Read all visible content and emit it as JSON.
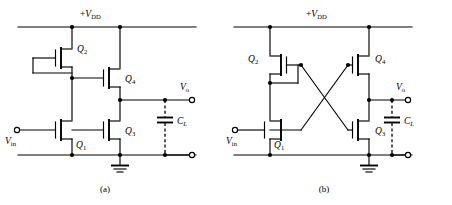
{
  "figure": {
    "panels": [
      {
        "id": "a",
        "caption": "(a)",
        "supply_label_prefix": "+",
        "supply_label_var": "V",
        "supply_label_sub": "DD",
        "input_label_var": "V",
        "input_label_sub": "in",
        "output_label_var": "V",
        "output_label_sub": "o",
        "cap_label_var": "C",
        "cap_label_sub": "L",
        "transistors": [
          {
            "name": "Q",
            "sub": "2",
            "label": "Q2"
          },
          {
            "name": "Q",
            "sub": "4",
            "label": "Q4"
          },
          {
            "name": "Q",
            "sub": "1",
            "label": "Q1"
          },
          {
            "name": "Q",
            "sub": "3",
            "label": "Q3"
          }
        ],
        "description": "Diode-connected load inverter: Q2 gate tied to its own drain node via left strap, Q4 gate driven from Q2 source node, Q1 input stage, Q3 output pulldown, CL load capacitor at Vo."
      },
      {
        "id": "b",
        "caption": "(b)",
        "supply_label_prefix": "+",
        "supply_label_var": "V",
        "supply_label_sub": "DD",
        "input_label_var": "V",
        "input_label_sub": "in",
        "output_label_var": "V",
        "output_label_sub": "o",
        "cap_label_var": "C",
        "cap_label_sub": "L",
        "transistors": [
          {
            "name": "Q",
            "sub": "2",
            "label": "Q2"
          },
          {
            "name": "Q",
            "sub": "4",
            "label": "Q4"
          },
          {
            "name": "Q",
            "sub": "1",
            "label": "Q1"
          },
          {
            "name": "Q",
            "sub": "3",
            "label": "Q3"
          }
        ],
        "description": "Cross-coupled inverter: Q2 gate wires across to Q3 gate and Q4 gate wires across to Q1 node, forming an X between the two halves, CL load capacitor at Vo."
      }
    ],
    "colors": {
      "wire": "#000000",
      "background": "#ffffff",
      "node": "#000000"
    }
  }
}
